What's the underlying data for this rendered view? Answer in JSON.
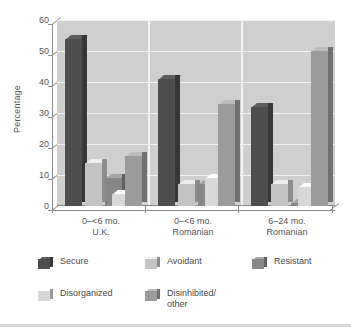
{
  "chart_data": {
    "type": "bar",
    "title": "",
    "subtitle": "",
    "xlabel": "",
    "ylabel": "Percentage",
    "ylim": [
      0,
      60
    ],
    "yticks": [
      0,
      10,
      20,
      30,
      40,
      50,
      60
    ],
    "grid": true,
    "legend_position": "bottom",
    "style": "3d-grouped-bars",
    "categories": [
      "0–<6 mo.\nU.K.",
      "0–<6 mo.\nRomanian",
      "6–24 mo.\nRomanian"
    ],
    "category_lines": [
      [
        "0–<6 mo.",
        "U.K."
      ],
      [
        "0–<6 mo.",
        "Romanian"
      ],
      [
        "6–24 mo.",
        "Romanian"
      ]
    ],
    "series": [
      {
        "name": "Secure",
        "color": "#4d4d4d",
        "values": [
          54,
          41,
          32
        ]
      },
      {
        "name": "Avoidant",
        "color": "#c3c3c3",
        "values": [
          14,
          7,
          7
        ]
      },
      {
        "name": "Resistant",
        "color": "#878787",
        "values": [
          9,
          7,
          1
        ]
      },
      {
        "name": "Disorganized",
        "color": "#d8d8d8",
        "values": [
          4,
          9,
          6
        ]
      },
      {
        "name": "Disinhibited/\nother",
        "color": "#9b9b9b",
        "values": [
          16,
          33,
          50
        ]
      }
    ]
  },
  "axis": {
    "ylabel": "Percentage",
    "tick_0": "0",
    "tick_10": "10",
    "tick_20": "20",
    "tick_30": "30",
    "tick_40": "40",
    "tick_50": "50",
    "tick_60": "60"
  },
  "xaxis": {
    "group1_line1": "0–<6 mo.",
    "group1_line2": "U.K.",
    "group2_line1": "0–<6 mo.",
    "group2_line2": "Romanian",
    "group3_line1": "6–24 mo.",
    "group3_line2": "Romanian"
  },
  "legend": {
    "item1": "Secure",
    "item2": "Avoidant",
    "item3": "Resistant",
    "item4": "Disorganized",
    "item5": "Disinhibited/\nother"
  },
  "colors": {
    "secure": "#4d4d4d",
    "avoidant": "#c3c3c3",
    "resistant": "#878787",
    "disorganized": "#d8d8d8",
    "disinhibited": "#9b9b9b",
    "plot_background": "#cfcfcf",
    "gridline": "#f3f3f3",
    "axis": "#8a8a8a",
    "text": "#555555"
  }
}
